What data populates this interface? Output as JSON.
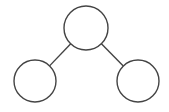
{
  "diagram": {
    "type": "tree",
    "canvas": {
      "width": 169,
      "height": 112,
      "background": "#ffffff"
    },
    "stroke_color": "#444444",
    "fill_color": "#ffffff",
    "stroke_width": 1.4,
    "nodes": [
      {
        "id": "root",
        "label": "",
        "cx": 86,
        "cy": 28,
        "r": 22
      },
      {
        "id": "left-child",
        "label": "",
        "cx": 35,
        "cy": 81,
        "r": 21
      },
      {
        "id": "right-child",
        "label": "",
        "cx": 138,
        "cy": 81,
        "r": 21
      }
    ],
    "edges": [
      {
        "from": "root",
        "to": "left-child"
      },
      {
        "from": "root",
        "to": "right-child"
      }
    ]
  }
}
